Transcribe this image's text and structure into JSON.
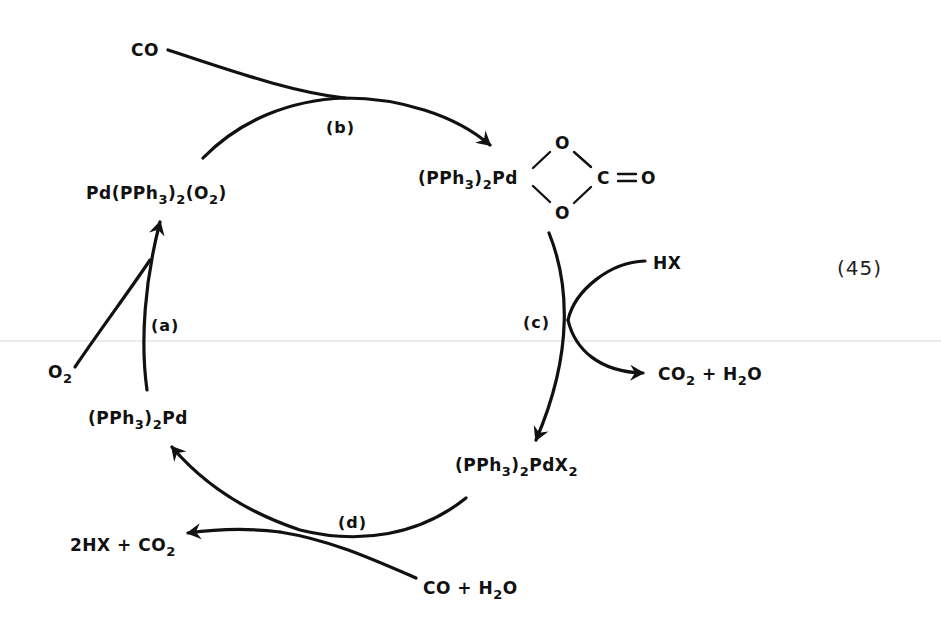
{
  "diagram": {
    "type": "catalytic-cycle",
    "equation_number": "(45)",
    "species": {
      "pd_o2_complex": {
        "parts": [
          "Pd(PPh",
          "3",
          ")",
          "2",
          "(O",
          "2",
          ")"
        ],
        "text": "Pd(PPh3)2(O2)"
      },
      "peroxocarbonate": {
        "prefix_parts": [
          "(PPh",
          "3",
          ")",
          "2",
          "Pd"
        ],
        "ring_top_atom": "O",
        "ring_bottom_atom": "O",
        "ring_right_atom": "C",
        "double_bond_atom": "O",
        "text": "(PPh3)2Pd(O2CO)"
      },
      "pd_x2": {
        "parts": [
          "(PPh",
          "3",
          ")",
          "2",
          "PdX",
          "2"
        ],
        "text": "(PPh3)2PdX2"
      },
      "pd0": {
        "parts": [
          "(PPh",
          "3",
          ")",
          "2",
          "Pd"
        ],
        "text": "(PPh3)2Pd"
      }
    },
    "reagents": {
      "co_in": "CO",
      "hx_in": "HX",
      "co2_h2o_out": {
        "parts": [
          "CO",
          "2",
          " + H",
          "2",
          "O"
        ],
        "text": "CO2 + H2O"
      },
      "o2_in": {
        "parts": [
          "O",
          "2"
        ],
        "text": "O2"
      },
      "co_h2o_in": {
        "parts": [
          "CO + H",
          "2",
          "O"
        ],
        "text": "CO + H2O"
      },
      "hx_co2_out": {
        "parts": [
          "2HX + CO",
          "2"
        ],
        "text": "2HX + CO2"
      }
    },
    "steps": {
      "a": "(a)",
      "b": "(b)",
      "c": "(c)",
      "d": "(d)"
    },
    "edges": [
      {
        "step": "a",
        "from": "(PPh3)2Pd",
        "to": "Pd(PPh3)2(O2)",
        "reagent_in": "O2"
      },
      {
        "step": "b",
        "from": "Pd(PPh3)2(O2)",
        "to": "(PPh3)2Pd(O2CO)",
        "reagent_in": "CO"
      },
      {
        "step": "c",
        "from": "(PPh3)2Pd(O2CO)",
        "to": "(PPh3)2PdX2",
        "reagent_in": "HX",
        "product_out": "CO2 + H2O"
      },
      {
        "step": "d",
        "from": "(PPh3)2PdX2",
        "to": "(PPh3)2Pd",
        "reagent_in": "CO + H2O",
        "product_out": "2HX + CO2"
      }
    ],
    "colors": {
      "ink": "#111111",
      "background": "#ffffff"
    }
  }
}
